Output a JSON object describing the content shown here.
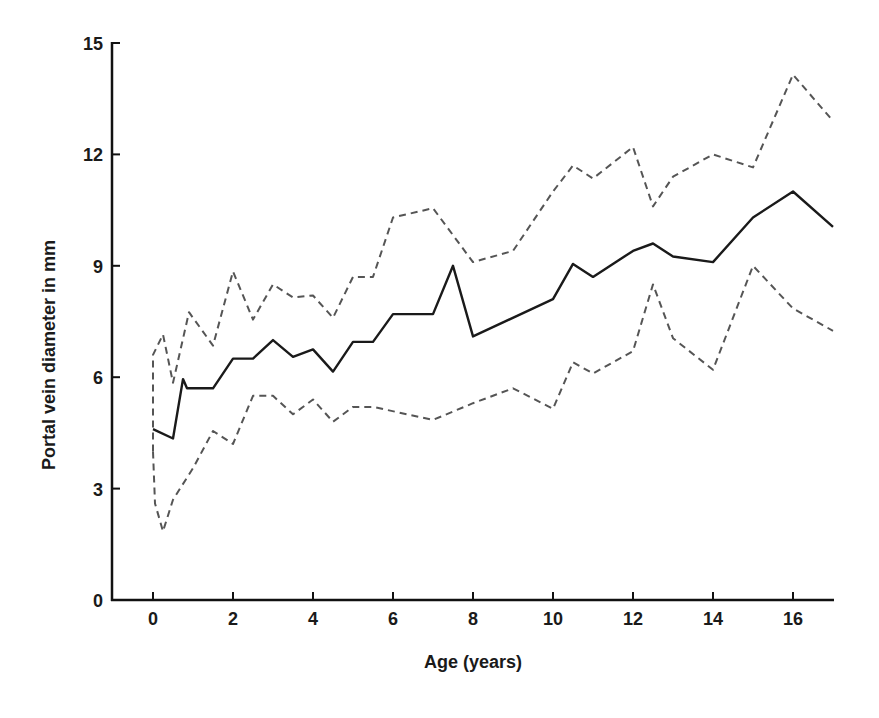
{
  "chart_data": {
    "type": "line",
    "title": "",
    "xlabel": "Age (years)",
    "ylabel": "Portal vein diameter in mm",
    "xlim": [
      -1,
      17
    ],
    "ylim": [
      0,
      15
    ],
    "xticks": [
      0,
      2,
      4,
      6,
      8,
      10,
      12,
      14,
      16
    ],
    "yticks": [
      0,
      3,
      6,
      9,
      12,
      15
    ],
    "grid": false,
    "legend": null,
    "series": [
      {
        "name": "Mean",
        "style": "solid",
        "color": "#1a1a1a",
        "points": [
          [
            0,
            4.6
          ],
          [
            0.5,
            4.35
          ],
          [
            0.75,
            5.95
          ],
          [
            0.85,
            5.7
          ],
          [
            1.5,
            5.7
          ],
          [
            2,
            6.5
          ],
          [
            2.5,
            6.5
          ],
          [
            3,
            7.0
          ],
          [
            3.5,
            6.55
          ],
          [
            4,
            6.75
          ],
          [
            4.5,
            6.15
          ],
          [
            5,
            6.95
          ],
          [
            5.5,
            6.95
          ],
          [
            6,
            7.7
          ],
          [
            7,
            7.7
          ],
          [
            7.5,
            9.0
          ],
          [
            8,
            7.1
          ],
          [
            10,
            8.1
          ],
          [
            10.5,
            9.05
          ],
          [
            11,
            8.7
          ],
          [
            12,
            9.4
          ],
          [
            12.5,
            9.6
          ],
          [
            13,
            9.25
          ],
          [
            14,
            9.1
          ],
          [
            15,
            10.3
          ],
          [
            16,
            11.0
          ],
          [
            17,
            10.05
          ]
        ]
      },
      {
        "name": "Upper bound",
        "style": "dashed",
        "color": "#555555",
        "points": [
          [
            0,
            4.0
          ],
          [
            0,
            6.6
          ],
          [
            0.25,
            7.15
          ],
          [
            0.5,
            5.85
          ],
          [
            0.9,
            7.75
          ],
          [
            1.5,
            6.85
          ],
          [
            2,
            8.85
          ],
          [
            2.5,
            7.55
          ],
          [
            3,
            8.5
          ],
          [
            3.5,
            8.15
          ],
          [
            4,
            8.2
          ],
          [
            4.5,
            7.6
          ],
          [
            5,
            8.7
          ],
          [
            5.5,
            8.7
          ],
          [
            6,
            10.3
          ],
          [
            7,
            10.55
          ],
          [
            8,
            9.1
          ],
          [
            9,
            9.4
          ],
          [
            10,
            11.0
          ],
          [
            10.5,
            11.7
          ],
          [
            11,
            11.35
          ],
          [
            12,
            12.2
          ],
          [
            12.5,
            10.6
          ],
          [
            13,
            11.4
          ],
          [
            14,
            12.0
          ],
          [
            15,
            11.65
          ],
          [
            16,
            14.15
          ],
          [
            17,
            12.9
          ]
        ]
      },
      {
        "name": "Lower bound",
        "style": "dashed",
        "color": "#555555",
        "points": [
          [
            0,
            4.0
          ],
          [
            0.05,
            2.6
          ],
          [
            0.25,
            1.85
          ],
          [
            0.5,
            2.7
          ],
          [
            1,
            3.55
          ],
          [
            1.5,
            4.55
          ],
          [
            2,
            4.2
          ],
          [
            2.5,
            5.5
          ],
          [
            3,
            5.5
          ],
          [
            3.5,
            5.0
          ],
          [
            4,
            5.4
          ],
          [
            4.5,
            4.8
          ],
          [
            5,
            5.2
          ],
          [
            5.5,
            5.2
          ],
          [
            7,
            4.85
          ],
          [
            8,
            5.3
          ],
          [
            9,
            5.7
          ],
          [
            10,
            5.15
          ],
          [
            10.5,
            6.4
          ],
          [
            11,
            6.1
          ],
          [
            12,
            6.7
          ],
          [
            12.5,
            8.5
          ],
          [
            13,
            7.05
          ],
          [
            14,
            6.2
          ],
          [
            15,
            9.0
          ],
          [
            16,
            7.85
          ],
          [
            17,
            7.25
          ]
        ]
      }
    ]
  },
  "axes": {
    "xlabel": "Age (years)",
    "ylabel": "Portal vein diameter in mm",
    "xtick_labels": [
      "0",
      "2",
      "4",
      "6",
      "8",
      "10",
      "12",
      "14",
      "16"
    ],
    "ytick_labels": [
      "0",
      "3",
      "6",
      "9",
      "12",
      "15"
    ]
  }
}
